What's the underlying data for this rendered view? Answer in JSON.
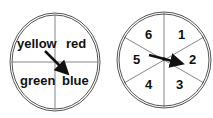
{
  "spinners": [
    {
      "name": "color-spinner",
      "sections": [
        "yellow",
        "red",
        "green",
        "blue"
      ],
      "arrow_points_to": "blue"
    },
    {
      "name": "number-spinner",
      "sections": [
        "1",
        "2",
        "3",
        "4",
        "5",
        "6"
      ],
      "arrow_points_to": "2"
    }
  ],
  "colors": {
    "line": "#333333",
    "arrow": "#111111"
  }
}
